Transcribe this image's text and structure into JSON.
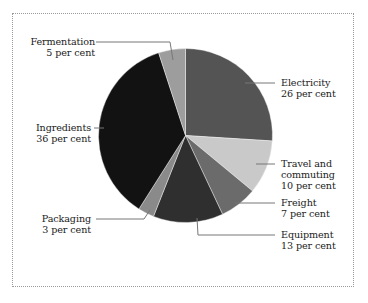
{
  "chart_data": {
    "type": "pie",
    "title": "",
    "start_angle": "12 o'clock",
    "direction": "clockwise",
    "slices": [
      {
        "name": "Electricity",
        "value": 26,
        "label": "26 per cent",
        "color": "#545454"
      },
      {
        "name": "Travel and commuting",
        "value": 10,
        "label": "10 per cent",
        "color": "#c9c9c9"
      },
      {
        "name": "Freight",
        "value": 7,
        "label": "7 per cent",
        "color": "#6b6b6b"
      },
      {
        "name": "Equipment",
        "value": 13,
        "label": "13 per cent",
        "color": "#2f2f2f"
      },
      {
        "name": "Packaging",
        "value": 3,
        "label": "3 per cent",
        "color": "#8a8a8a"
      },
      {
        "name": "Ingredients",
        "value": 36,
        "label": "36 per cent",
        "color": "#121212"
      },
      {
        "name": "Fermentation",
        "value": 5,
        "label": "5 per cent",
        "color": "#9d9d9d"
      }
    ],
    "units": "per cent",
    "legend": "none (leader-line labels)"
  },
  "labels": {
    "fermentation": {
      "line1": "Fermentation",
      "line2": "5 per cent"
    },
    "ingredients": {
      "line1": "Ingredients",
      "line2": "36 per cent"
    },
    "packaging": {
      "line1": "Packaging",
      "line2": "3 per cent"
    },
    "electricity": {
      "line1": "Electricity",
      "line2": "26 per cent"
    },
    "travel": {
      "line1": "Travel and",
      "line2": "commuting",
      "line3": "10 per cent"
    },
    "freight": {
      "line1": "Freight",
      "line2": "7 per cent"
    },
    "equipment": {
      "line1": "Equipment",
      "line2": "13 per cent"
    }
  }
}
